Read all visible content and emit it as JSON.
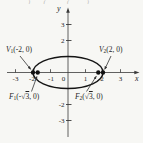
{
  "meta": {
    "background": "#f7f7f4",
    "ink": "#1f1f1f",
    "axis_color": "#3a3a3a",
    "curve_color": "#141414"
  },
  "top_fragment": "‾ ‾) ‾ ( ‾ ‾ ( ‾ ‾)",
  "axes": {
    "x_label": "x",
    "y_label": "y",
    "origin_label": "0",
    "x_tick_labels": [
      "-3",
      "-2",
      "-1",
      "1",
      "2",
      "3"
    ],
    "y_tick_labels": [
      "3",
      "2",
      "-2",
      "-3"
    ]
  },
  "points": {
    "v1": {
      "base": "V",
      "sub": "1",
      "coords": "(-2, 0)"
    },
    "v2": {
      "base": "V",
      "sub": "2",
      "coords": "(2, 0)"
    },
    "f1": {
      "base": "F",
      "sub": "1",
      "open": "(-√",
      "rad": "3",
      "close": ", 0)"
    },
    "f2": {
      "base": "F",
      "sub": "2",
      "open": "(√",
      "rad": "3",
      "close": ", 0)"
    }
  },
  "geometry": {
    "shape": "ellipse",
    "semi_major_axis_a": 2,
    "semi_minor_axis_b": 1,
    "vertices": [
      [
        -2,
        0
      ],
      [
        2,
        0
      ]
    ],
    "foci": [
      "(-√3, 0)",
      "(√3, 0)"
    ],
    "x_axis_range": [
      -3,
      3
    ],
    "y_axis_range": [
      -3,
      3
    ]
  }
}
